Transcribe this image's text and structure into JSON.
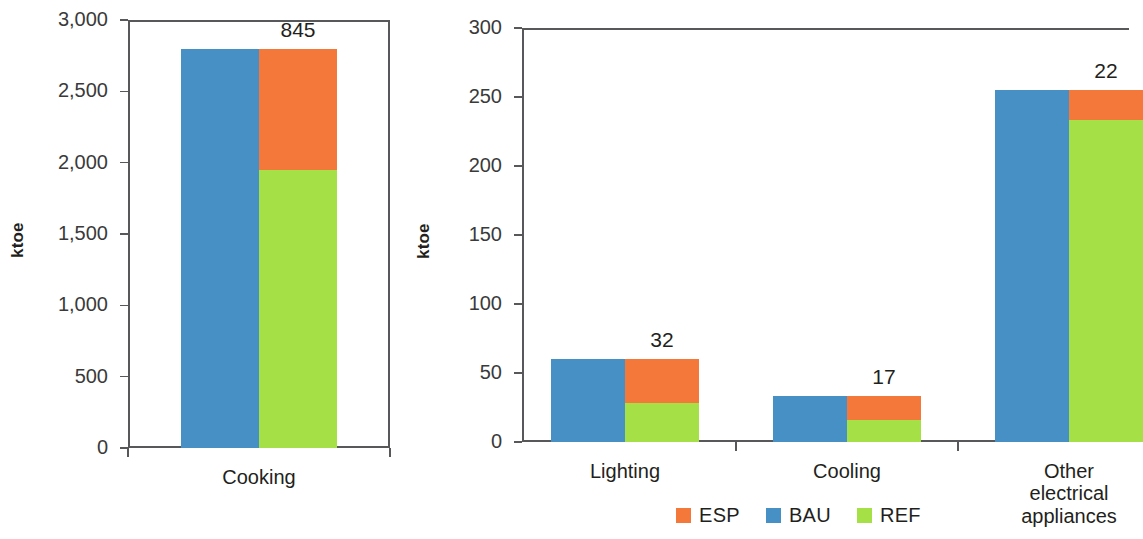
{
  "colors": {
    "esp": "#f4783a",
    "bau": "#4790c6",
    "ref": "#a6e047",
    "axis": "#58585b",
    "text": "#231f20"
  },
  "legend": {
    "items": [
      {
        "label": "ESP",
        "color_key": "esp"
      },
      {
        "label": "BAU",
        "color_key": "bau"
      },
      {
        "label": "REF",
        "color_key": "ref"
      }
    ]
  },
  "chart_data": [
    {
      "id": "cooking",
      "type": "bar",
      "subtype": "stacked-paired",
      "title": "",
      "xlabel": "",
      "ylabel": "ktoe",
      "ylim": [
        0,
        3000
      ],
      "yticks": [
        0,
        500,
        1000,
        1500,
        2000,
        2500,
        3000
      ],
      "ytick_labels": [
        "0",
        "500",
        "1,000",
        "1,500",
        "2,000",
        "2,500",
        "3,000"
      ],
      "grid": false,
      "legend_position": "bottom-center-shared",
      "categories": [
        "Cooking"
      ],
      "series": [
        {
          "name": "BAU",
          "values": [
            2795
          ]
        },
        {
          "name": "REF",
          "values": [
            1950
          ]
        },
        {
          "name": "ESP",
          "values": [
            845
          ]
        }
      ],
      "data_labels": [
        "845"
      ]
    },
    {
      "id": "lighting-cooling-appliances",
      "type": "bar",
      "subtype": "stacked-paired",
      "title": "",
      "xlabel": "",
      "ylabel": "ktoe",
      "ylim": [
        0,
        300
      ],
      "yticks": [
        0,
        50,
        100,
        150,
        200,
        250,
        300
      ],
      "ytick_labels": [
        "0",
        "50",
        "100",
        "150",
        "200",
        "250",
        "300"
      ],
      "grid": false,
      "legend_position": "bottom-center-shared",
      "categories": [
        "Lighting",
        "Cooling",
        "Other electrical\nappliances"
      ],
      "series": [
        {
          "name": "BAU",
          "values": [
            60,
            33,
            255
          ]
        },
        {
          "name": "REF",
          "values": [
            28,
            16,
            233
          ]
        },
        {
          "name": "ESP",
          "values": [
            32,
            17,
            22
          ]
        }
      ],
      "data_labels": [
        "32",
        "17",
        "22"
      ]
    }
  ]
}
